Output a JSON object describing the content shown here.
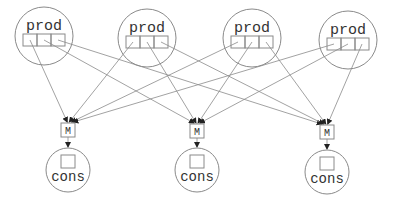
{
  "diagram": {
    "producers": [
      {
        "label": "prod",
        "cx": 44,
        "cy": 36,
        "r": 29,
        "slots": 3
      },
      {
        "label": "prod",
        "cx": 147,
        "cy": 38,
        "r": 29,
        "slots": 3
      },
      {
        "label": "prod",
        "cx": 252,
        "cy": 38,
        "r": 29,
        "slots": 3
      },
      {
        "label": "prod",
        "cx": 348,
        "cy": 40,
        "r": 29,
        "slots": 3
      }
    ],
    "mergers": [
      {
        "label": "M",
        "cx": 68,
        "cy": 130
      },
      {
        "label": "M",
        "cx": 197,
        "cy": 131
      },
      {
        "label": "M",
        "cx": 327,
        "cy": 132
      }
    ],
    "consumers": [
      {
        "label": "cons",
        "cx": 68,
        "cy": 170,
        "r": 22
      },
      {
        "label": "cons",
        "cx": 197,
        "cy": 170,
        "r": 22
      },
      {
        "label": "cons",
        "cx": 327,
        "cy": 172,
        "r": 22
      }
    ],
    "edges_description": "Each producer has 3 slots; slot i of every producer connects to merger i; each merger connects to its consumer"
  }
}
